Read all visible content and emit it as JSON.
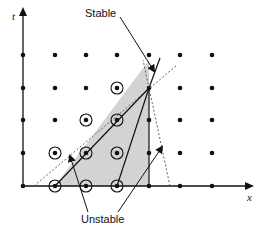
{
  "diagram": {
    "type": "stencil-stability-diagram",
    "axes": {
      "x_label": "x",
      "t_label": "t"
    },
    "annotations": {
      "stable_label": "Stable",
      "unstable_label": "Unstable"
    },
    "grid": {
      "columns_px": [
        23,
        55,
        86,
        117,
        149,
        180,
        212
      ],
      "rows_px": [
        55,
        88,
        120,
        153,
        186
      ]
    },
    "stencil_points": [
      {
        "col": 2,
        "row": 0,
        "role": "origin"
      },
      {
        "col": 3,
        "row": 0
      },
      {
        "col": 4,
        "row": 0
      },
      {
        "col": 2,
        "row": 1
      },
      {
        "col": 3,
        "row": 1
      },
      {
        "col": 4,
        "row": 1
      },
      {
        "col": 3,
        "row": 2
      },
      {
        "col": 4,
        "row": 2
      },
      {
        "col": 4,
        "row": 3
      }
    ],
    "apex": {
      "col": 4,
      "row": 3
    },
    "colors": {
      "shaded_region": "#d3d3d3",
      "ink": "#111111",
      "dotted": "#555555"
    }
  }
}
